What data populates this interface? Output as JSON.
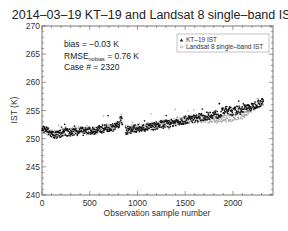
{
  "chart_data": {
    "type": "scatter",
    "title": "2014–03–19 KT–19 and Landsat 8 single–band IST",
    "xlabel": "Observation sample number",
    "ylabel": "IST (K)",
    "xlim": [
      0,
      2420
    ],
    "ylim": [
      240,
      270
    ],
    "xticks": [
      0,
      500,
      1000,
      1500,
      2000
    ],
    "yticks": [
      240,
      245,
      250,
      255,
      260,
      265,
      270
    ],
    "grid": false,
    "legend_position": "upper right",
    "annotations": {
      "bias": "bias = −0.03 K",
      "rmse_prefix": "RMSE",
      "rmse_sub": "nobias",
      "rmse_value": " = 0.76 K",
      "case": "Case # = 2320"
    },
    "series": [
      {
        "name": "KT–19 IST",
        "marker": "triangle",
        "color": "#111111",
        "x": [
          0,
          50,
          100,
          150,
          200,
          250,
          300,
          350,
          400,
          450,
          500,
          550,
          600,
          650,
          700,
          750,
          800,
          830,
          880,
          920,
          960,
          1000,
          1050,
          1100,
          1150,
          1200,
          1250,
          1300,
          1350,
          1400,
          1450,
          1500,
          1550,
          1600,
          1650,
          1700,
          1750,
          1800,
          1850,
          1900,
          1950,
          2000,
          2050,
          2100,
          2150,
          2200,
          2250,
          2300,
          2350
        ],
        "values": [
          251.8,
          251.5,
          250.8,
          250.6,
          250.9,
          251.2,
          251.0,
          251.3,
          251.4,
          251.2,
          251.5,
          251.3,
          251.6,
          251.8,
          251.9,
          252.0,
          252.4,
          253.5,
          251.4,
          251.6,
          251.7,
          251.8,
          251.9,
          252.0,
          252.1,
          252.3,
          252.5,
          252.6,
          252.7,
          253.0,
          253.1,
          253.3,
          253.5,
          253.6,
          253.8,
          253.9,
          254.1,
          254.4,
          254.2,
          254.9,
          255.0,
          254.8,
          255.1,
          255.3,
          255.5,
          255.6,
          256.2,
          256.4,
          256.6
        ]
      },
      {
        "name": "Landsat 8 single–band IST",
        "marker": "circle",
        "color": "#9a9a9a",
        "x": [
          0,
          50,
          100,
          150,
          200,
          250,
          300,
          350,
          400,
          450,
          500,
          550,
          600,
          650,
          700,
          750,
          800,
          830,
          880,
          920,
          960,
          1000,
          1050,
          1100,
          1150,
          1200,
          1250,
          1300,
          1350,
          1400,
          1450,
          1500,
          1550,
          1600,
          1650,
          1700,
          1750,
          1800,
          1850,
          1900,
          1950,
          2000,
          2050,
          2100,
          2150,
          2200,
          2250,
          2300,
          2350
        ],
        "values": [
          251.6,
          251.3,
          250.9,
          250.7,
          251.0,
          251.4,
          251.2,
          251.5,
          251.5,
          251.3,
          251.6,
          251.4,
          251.7,
          251.9,
          252.0,
          252.2,
          252.6,
          253.8,
          251.5,
          251.7,
          251.8,
          251.9,
          252.0,
          252.1,
          252.2,
          252.4,
          252.6,
          252.7,
          252.8,
          253.1,
          253.2,
          253.4,
          253.4,
          253.5,
          253.5,
          253.4,
          253.5,
          253.3,
          253.5,
          253.6,
          253.7,
          253.8,
          254.0,
          254.2,
          254.8,
          255.4,
          256.0,
          256.3,
          256.5
        ]
      }
    ]
  }
}
